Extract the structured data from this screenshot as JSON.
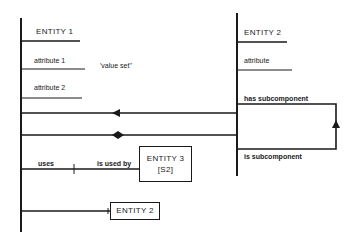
{
  "diagram": {
    "left_entity": {
      "name": "ENTITY 1",
      "attributes": [
        "attribute 1",
        "attribute 2"
      ],
      "annotation": "'value set''"
    },
    "right_entity": {
      "name": "ENTITY 2",
      "attributes": [
        "attribute"
      ]
    },
    "self_relation": {
      "top_label": "has subcomponent",
      "bottom_label": "is subcomponent"
    },
    "use_relation": {
      "left_label": "uses",
      "right_label": "is used by"
    },
    "entity3_box": {
      "name": "ENTITY 3",
      "sub": "[S2]"
    },
    "entity2_box": {
      "name": "ENTITY 2"
    },
    "colors": {
      "line": "#1a1a1a",
      "background": "#ffffff"
    }
  }
}
